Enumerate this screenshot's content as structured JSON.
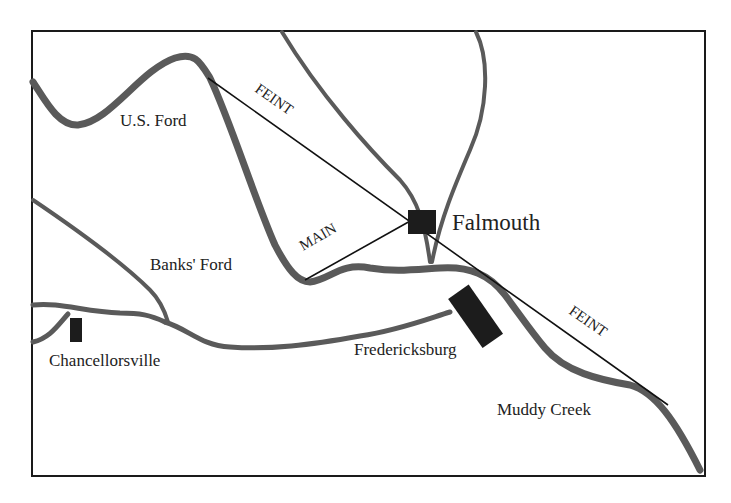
{
  "map": {
    "title": "",
    "labels": {
      "us_ford": "U.S. Ford",
      "banks_ford": "Banks' Ford",
      "falmouth": "Falmouth",
      "chancellorsville": "Chancellorsville",
      "fredericksburg": "Fredericksburg",
      "muddy_creek": "Muddy Creek",
      "feint_north": "FEINT",
      "feint_south": "FEINT",
      "main": "MAIN"
    },
    "colors": {
      "frame": "#1a1a1a",
      "river": "#5a5a5a",
      "town_marker": "#1c1c1c",
      "attack_line": "#111111",
      "background": "#ffffff"
    }
  }
}
